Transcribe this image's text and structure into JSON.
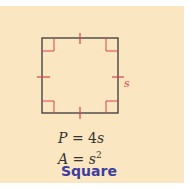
{
  "shape": {
    "name": "Square",
    "side_label": "s",
    "perimeter": {
      "var": "P",
      "eq": "=",
      "coef": "4",
      "term": "s"
    },
    "area": {
      "var": "A",
      "eq": "=",
      "base": "s",
      "exp": "2"
    }
  },
  "colors": {
    "background": "#fbe6c2",
    "outline": "#3a3a3a",
    "marks": "#e0424a",
    "title": "#3b3da0"
  }
}
